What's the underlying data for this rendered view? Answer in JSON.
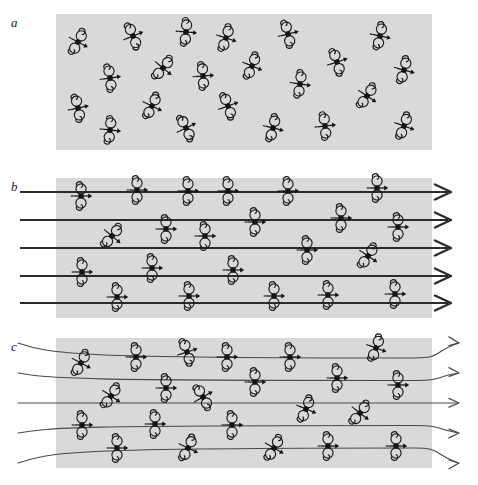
{
  "figure": {
    "width": 478,
    "height": 485,
    "background_color": "#ffffff",
    "slab_color": "#d9d9d9",
    "ink_color": "#141414",
    "fieldline_color": "#2b2b2b",
    "fieldline_thin_color": "#4a4a4a"
  },
  "panels": [
    {
      "label": "a",
      "label_x": 11,
      "label_y": 16,
      "caption_meaning": "randomly oriented polar molecules, no applied field",
      "slab": {
        "x": 56,
        "y": 14,
        "w": 376,
        "h": 136
      },
      "field_lines": [],
      "molecules": [
        {
          "x": 78,
          "y": 42,
          "angle": 28
        },
        {
          "x": 133,
          "y": 36,
          "angle": -22
        },
        {
          "x": 186,
          "y": 32,
          "angle": 5
        },
        {
          "x": 226,
          "y": 38,
          "angle": 18
        },
        {
          "x": 288,
          "y": 34,
          "angle": -14
        },
        {
          "x": 380,
          "y": 36,
          "angle": 12
        },
        {
          "x": 110,
          "y": 78,
          "angle": -8
        },
        {
          "x": 163,
          "y": 68,
          "angle": 40
        },
        {
          "x": 203,
          "y": 76,
          "angle": -4
        },
        {
          "x": 252,
          "y": 66,
          "angle": 22
        },
        {
          "x": 337,
          "y": 62,
          "angle": -18
        },
        {
          "x": 300,
          "y": 84,
          "angle": 8
        },
        {
          "x": 404,
          "y": 70,
          "angle": 15
        },
        {
          "x": 78,
          "y": 108,
          "angle": -12
        },
        {
          "x": 152,
          "y": 106,
          "angle": 26
        },
        {
          "x": 228,
          "y": 106,
          "angle": -20
        },
        {
          "x": 367,
          "y": 96,
          "angle": 34
        },
        {
          "x": 110,
          "y": 130,
          "angle": 6
        },
        {
          "x": 186,
          "y": 128,
          "angle": -26
        },
        {
          "x": 273,
          "y": 128,
          "angle": 14
        },
        {
          "x": 325,
          "y": 126,
          "angle": -6
        },
        {
          "x": 404,
          "y": 126,
          "angle": 20
        }
      ]
    },
    {
      "label": "b",
      "label_x": 11,
      "label_y": 180,
      "caption_meaning": "dipoles aligned by a strong uniform field, straight field lines",
      "slab": {
        "x": 56,
        "y": 178,
        "w": 376,
        "h": 140
      },
      "field_lines": [
        {
          "x1": 20,
          "y1": 192,
          "x2": 448,
          "y2": 192,
          "style": "thick"
        },
        {
          "x1": 20,
          "y1": 220,
          "x2": 448,
          "y2": 220,
          "style": "thick"
        },
        {
          "x1": 20,
          "y1": 248,
          "x2": 448,
          "y2": 248,
          "style": "thick"
        },
        {
          "x1": 20,
          "y1": 276,
          "x2": 448,
          "y2": 276,
          "style": "thick"
        },
        {
          "x1": 20,
          "y1": 303,
          "x2": 448,
          "y2": 303,
          "style": "thick"
        }
      ],
      "molecules": [
        {
          "x": 81,
          "y": 196,
          "angle": 0
        },
        {
          "x": 137,
          "y": 190,
          "angle": 0
        },
        {
          "x": 188,
          "y": 191,
          "angle": 0
        },
        {
          "x": 228,
          "y": 191,
          "angle": 0
        },
        {
          "x": 288,
          "y": 191,
          "angle": 0
        },
        {
          "x": 377,
          "y": 188,
          "angle": 0
        },
        {
          "x": 255,
          "y": 222,
          "angle": 0
        },
        {
          "x": 341,
          "y": 218,
          "angle": 0
        },
        {
          "x": 112,
          "y": 236,
          "angle": 40
        },
        {
          "x": 166,
          "y": 229,
          "angle": 0
        },
        {
          "x": 205,
          "y": 236,
          "angle": 0
        },
        {
          "x": 398,
          "y": 227,
          "angle": 0
        },
        {
          "x": 307,
          "y": 250,
          "angle": 0
        },
        {
          "x": 368,
          "y": 256,
          "angle": 34
        },
        {
          "x": 82,
          "y": 272,
          "angle": 0
        },
        {
          "x": 152,
          "y": 268,
          "angle": 0
        },
        {
          "x": 233,
          "y": 270,
          "angle": 0
        },
        {
          "x": 117,
          "y": 297,
          "angle": 0
        },
        {
          "x": 189,
          "y": 296,
          "angle": 0
        },
        {
          "x": 274,
          "y": 296,
          "angle": 0
        },
        {
          "x": 328,
          "y": 295,
          "angle": 0
        },
        {
          "x": 395,
          "y": 294,
          "angle": 0
        }
      ]
    },
    {
      "label": "c",
      "label_x": 11,
      "label_y": 340,
      "caption_meaning": "dipoles aligned in a weaker fringing field, curved field lines",
      "slab": {
        "x": 56,
        "y": 338,
        "w": 376,
        "h": 130
      },
      "field_lines": [
        {
          "style": "thin-curved",
          "row": 0
        },
        {
          "style": "thin-curved",
          "row": 1
        },
        {
          "style": "thin-curved",
          "row": 2
        },
        {
          "style": "thin-curved",
          "row": 3
        },
        {
          "style": "thin-curved",
          "row": 4
        }
      ],
      "molecules": [
        {
          "x": 81,
          "y": 363,
          "angle": 28
        },
        {
          "x": 136,
          "y": 357,
          "angle": 0
        },
        {
          "x": 187,
          "y": 352,
          "angle": -18
        },
        {
          "x": 227,
          "y": 357,
          "angle": 0
        },
        {
          "x": 290,
          "y": 357,
          "angle": 0
        },
        {
          "x": 376,
          "y": 348,
          "angle": 20
        },
        {
          "x": 255,
          "y": 382,
          "angle": 0
        },
        {
          "x": 337,
          "y": 378,
          "angle": 0
        },
        {
          "x": 111,
          "y": 396,
          "angle": 34
        },
        {
          "x": 166,
          "y": 388,
          "angle": 0
        },
        {
          "x": 203,
          "y": 397,
          "angle": -30
        },
        {
          "x": 398,
          "y": 385,
          "angle": 0
        },
        {
          "x": 306,
          "y": 409,
          "angle": 22
        },
        {
          "x": 360,
          "y": 413,
          "angle": 38
        },
        {
          "x": 82,
          "y": 425,
          "angle": 0
        },
        {
          "x": 155,
          "y": 424,
          "angle": 0
        },
        {
          "x": 232,
          "y": 425,
          "angle": 0
        },
        {
          "x": 117,
          "y": 448,
          "angle": 0
        },
        {
          "x": 188,
          "y": 448,
          "angle": 26
        },
        {
          "x": 274,
          "y": 448,
          "angle": 30
        },
        {
          "x": 328,
          "y": 446,
          "angle": 0
        },
        {
          "x": 396,
          "y": 446,
          "angle": 0
        }
      ]
    }
  ]
}
